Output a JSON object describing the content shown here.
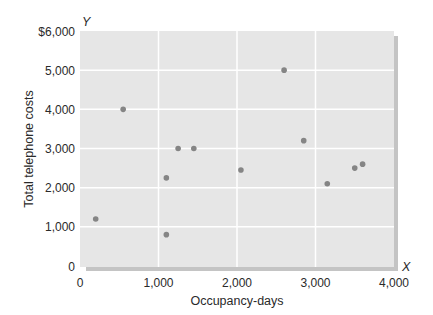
{
  "chart_data": {
    "type": "scatter",
    "title": "",
    "xlabel": "Occupancy-days",
    "ylabel": "Total telephone costs",
    "x_axis_letter": "X",
    "y_axis_letter": "Y",
    "xlim": [
      0,
      4000
    ],
    "ylim": [
      0,
      6000
    ],
    "x_ticks": [
      0,
      1000,
      2000,
      3000,
      4000
    ],
    "x_tick_labels": [
      "0",
      "1,000",
      "2,000",
      "3,000",
      "4,000"
    ],
    "y_ticks": [
      0,
      1000,
      2000,
      3000,
      4000,
      5000,
      6000
    ],
    "y_tick_labels": [
      "0",
      "1,000",
      "2,000",
      "3,000",
      "4,000",
      "5,000",
      "$6,000"
    ],
    "grid": true,
    "legend": null,
    "points": [
      {
        "x": 200,
        "y": 1200
      },
      {
        "x": 550,
        "y": 4000
      },
      {
        "x": 1100,
        "y": 800
      },
      {
        "x": 1100,
        "y": 2250
      },
      {
        "x": 1250,
        "y": 3000
      },
      {
        "x": 1450,
        "y": 3000
      },
      {
        "x": 2050,
        "y": 2450
      },
      {
        "x": 2600,
        "y": 5000
      },
      {
        "x": 2850,
        "y": 3200
      },
      {
        "x": 3150,
        "y": 2100
      },
      {
        "x": 3500,
        "y": 2500
      },
      {
        "x": 3600,
        "y": 2600
      }
    ]
  },
  "colors": {
    "plot_background": "#e6e6e6",
    "gridline": "#ffffff",
    "point": "#858585",
    "shadow": "#bdbdbd",
    "text": "#2a2a2a"
  }
}
